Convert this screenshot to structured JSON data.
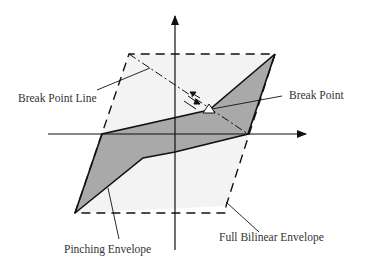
{
  "diagram": {
    "type": "hysteresis-envelope",
    "labels": {
      "break_point_line": "Break Point Line",
      "break_point": "Break Point",
      "pinching_envelope": "Pinching Envelope",
      "full_bilinear_envelope": "Full Bilinear Envelope"
    },
    "colors": {
      "background": "#ffffff",
      "envelope_fill": "#f2f2f2",
      "pinching_fill": "#a9a9a9",
      "stroke": "#111111",
      "text": "#333333"
    }
  }
}
